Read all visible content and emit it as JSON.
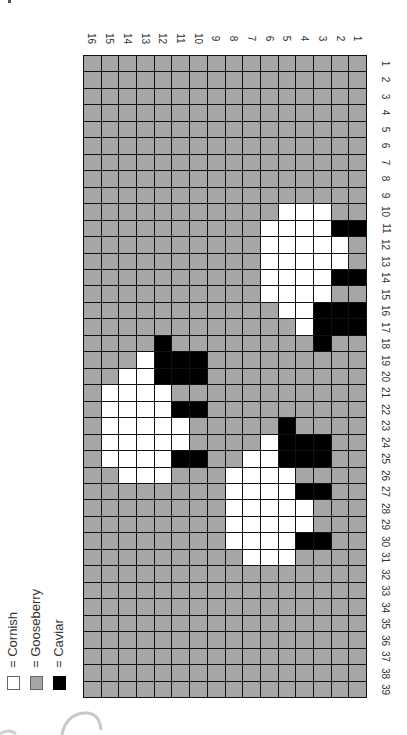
{
  "chart_data": {
    "type": "heatmap",
    "title": "",
    "legend": [
      {
        "key": "W",
        "label": "Cornish",
        "symbol": "=",
        "color": "#ffffff"
      },
      {
        "key": "G",
        "label": "Gooseberry",
        "symbol": "=",
        "color": "#a6a6a6"
      },
      {
        "key": "B",
        "label": "Caviar",
        "symbol": "=",
        "color": "#000000"
      }
    ],
    "column_labels_left_to_right": [
      "16",
      "15",
      "14",
      "13",
      "12",
      "11",
      "10",
      "9",
      "8",
      "7",
      "6",
      "5",
      "4",
      "3",
      "2",
      "1"
    ],
    "row_labels_top_to_bottom": [
      "1",
      "2",
      "3",
      "4",
      "5",
      "6",
      "7",
      "8",
      "9",
      "10",
      "11",
      "12",
      "13",
      "14",
      "15",
      "16",
      "17",
      "18",
      "19",
      "20",
      "21",
      "22",
      "23",
      "24",
      "25",
      "26",
      "27",
      "28",
      "29",
      "30",
      "31",
      "32",
      "33",
      "34",
      "35",
      "36",
      "37",
      "38",
      "39"
    ],
    "rows_note": "Each string lists cells left-to-right (column 16 down to column 1). W=Cornish, G=Gooseberry, B=Caviar",
    "rows": [
      "GGGGGGGGGGGGGGGG",
      "GGGGGGGGGGGGGGGG",
      "GGGGGGGGGGGGGGGG",
      "GGGGGGGGGGGGGGGG",
      "GGGGGGGGGGGGGGGG",
      "GGGGGGGGGGGGGGGG",
      "GGGGGGGGGGGGGGGG",
      "GGGGGGGGGGGGGGGG",
      "GGGGGGGGGGGGGGGG",
      "GGGGGGGGGGGWWWGG",
      "GGGGGGGGGGWWWWBB",
      "GGGGGGGGGGWWWWWG",
      "GGGGGGGGGGWWWWWG",
      "GGGGGGGGGGWWWWBB",
      "GGGGGGGGGGWWWWGG",
      "GGGGGGGGGGGWWBBB",
      "GGGGGGGGGGGGWBBB",
      "GGGGBGGGGGGGGBGG",
      "GGGWBBBGGGGGGGGG",
      "GGWWBBBGGGGGGGGG",
      "GWWWWGGGGGGGGGGG",
      "GWWWWBBGGGGGGGGG",
      "GWWWWWGGGGGBGGGG",
      "GWWWWWGGGGWBBBGG",
      "GWWWWBBGGWWBBBGG",
      "GGWWWGGGWWWWGGGG",
      "GGGGGGGGWWWWBBGG",
      "GGGGGGGGWWWWWGGG",
      "GGGGGGGGWWWWWGGG",
      "GGGGGGGGWWWWBBGG",
      "GGGGGGGGGWWWGGGG",
      "GGGGGGGGGGGGGGGG",
      "GGGGGGGGGGGGGGGG",
      "GGGGGGGGGGGGGGGG",
      "GGGGGGGGGGGGGGGG",
      "GGGGGGGGGGGGGGGG",
      "GGGGGGGGGGGGGGGG",
      "GGGGGGGGGGGGGGGG",
      "GGGGGGGGGGGGGGGG"
    ],
    "grid": true,
    "xlabel": "",
    "ylabel": ""
  },
  "legend": {
    "items": [
      {
        "symbol": "=",
        "label": "Cornish",
        "text": "= Cornish"
      },
      {
        "symbol": "=",
        "label": "Gooseberry",
        "text": "= Gooseberry"
      },
      {
        "symbol": "=",
        "label": "Caviar",
        "text": "= Caviar"
      }
    ]
  }
}
